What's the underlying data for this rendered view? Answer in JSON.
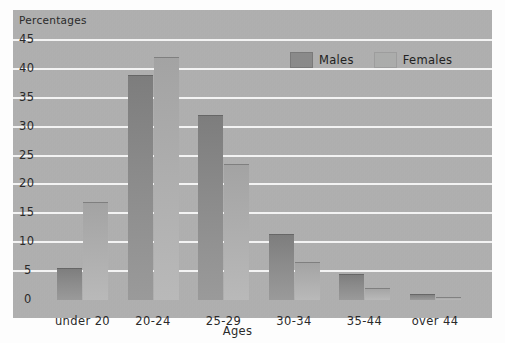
{
  "page": {
    "header_ghost": "____ ___"
  },
  "chart_data": {
    "type": "bar",
    "title": "",
    "xlabel": "Ages",
    "ylabel": "Percentages",
    "categories": [
      "under 20",
      "20-24",
      "25-29",
      "30-34",
      "35-44",
      "over 44"
    ],
    "series": [
      {
        "name": "Males",
        "color": "#8a8a8a",
        "values": [
          5.5,
          39,
          32,
          11.5,
          4.5,
          1
        ]
      },
      {
        "name": "Females",
        "color": "#abacab",
        "values": [
          17,
          42,
          23.5,
          6.5,
          2,
          0.5
        ]
      }
    ],
    "ylim": [
      0,
      47
    ],
    "yticks": [
      0,
      5,
      10,
      15,
      20,
      25,
      30,
      35,
      40,
      45
    ],
    "ytick_labels": [
      "0",
      "5",
      "10",
      "15",
      "20",
      "25",
      "30",
      "35",
      "40",
      "45"
    ],
    "grid": true,
    "grid_color": "#f3f3f3",
    "plot_background": "#b2b2b2",
    "legend_position": "top-right"
  }
}
